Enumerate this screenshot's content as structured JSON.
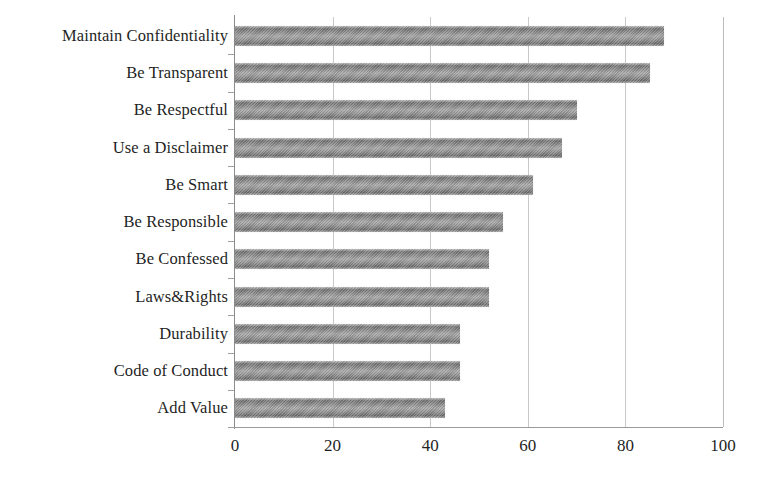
{
  "chart_data": {
    "type": "bar",
    "orientation": "horizontal",
    "title": "",
    "subtitle": "",
    "xlabel": "",
    "ylabel": "",
    "categories": [
      "Maintain Confidentiality",
      "Be Transparent",
      "Be Respectful",
      "Use a Disclaimer",
      "Be Smart",
      "Be Responsible",
      "Be Confessed",
      "Laws&Rights",
      "Durability",
      "Code of Conduct",
      "Add Value"
    ],
    "values": [
      88,
      85,
      70,
      67,
      61,
      55,
      52,
      52,
      46,
      46,
      43
    ],
    "xlim": [
      0,
      100
    ],
    "xticks": [
      0,
      20,
      40,
      60,
      80,
      100
    ],
    "xtick_labels": [
      "0",
      "20",
      "40",
      "60",
      "80",
      "100"
    ],
    "grid": "vertical",
    "legend": "none",
    "series": [
      {
        "name": "",
        "values": [
          88,
          85,
          70,
          67,
          61,
          55,
          52,
          52,
          46,
          46,
          43
        ]
      }
    ]
  },
  "style": {
    "bar_color": "#8a8a8a",
    "bar_edge_color": "#6b6b6b",
    "grid_color": "#c9c9c9",
    "axis_color": "#9a9a9a",
    "text_color": "#1f1f1f",
    "background": "#ffffff"
  }
}
